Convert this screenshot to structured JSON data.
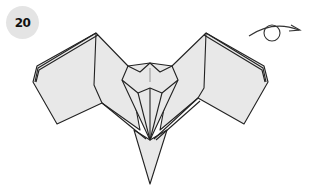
{
  "step": {
    "number": "20"
  },
  "symbol": {
    "name": "turn-over-icon",
    "meaning": "Turn the model over"
  },
  "colors": {
    "paper": "#e8e8e8",
    "line": "#222222",
    "badge": "#e4e4e4"
  }
}
